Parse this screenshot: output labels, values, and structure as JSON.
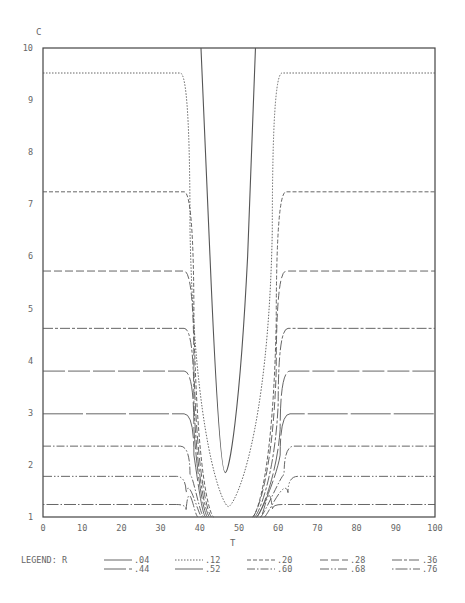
{
  "chart_data": {
    "type": "line",
    "title": "",
    "xlabel": "T",
    "ylabel": "C",
    "xlim": [
      0,
      100
    ],
    "ylim": [
      1,
      10
    ],
    "x_ticks": [
      0,
      10,
      20,
      30,
      40,
      50,
      60,
      70,
      80,
      90,
      100
    ],
    "y_ticks": [
      1,
      2,
      3,
      4,
      5,
      6,
      7,
      8,
      9,
      10
    ],
    "grid": false,
    "legend_title": "LEGEND: R",
    "legend_position": "bottom",
    "series": [
      {
        "name": ".04",
        "dash": "solid",
        "plateau": 10.0,
        "min": 1.85,
        "left_knee": 40.3,
        "right_knee": 54.2,
        "min_t": 46.5,
        "dip_bottom_width": 6
      },
      {
        "name": ".12",
        "dash": "dotted",
        "plateau": 9.52,
        "min": 1.2,
        "left_knee": 35,
        "right_knee": 61,
        "min_t": 47.3,
        "dip_bottom_width": 6
      },
      {
        "name": ".20",
        "dash": "dashed",
        "plateau": 7.24,
        "min": 1.0,
        "left_knee": 36,
        "right_knee": 62,
        "min_t": 47.5,
        "dip_bottom_width": 8
      },
      {
        "name": ".28",
        "dash": "longdash",
        "plateau": 5.72,
        "min": 1.0,
        "left_knee": 36,
        "right_knee": 62,
        "min_t": 47.5,
        "dip_bottom_width": 9
      },
      {
        "name": ".36",
        "dash": "longshort",
        "plateau": 4.62,
        "min": 1.0,
        "left_knee": 36,
        "right_knee": 62.5,
        "min_t": 47.5,
        "dip_bottom_width": 10
      },
      {
        "name": ".44",
        "dash": "solid-gap",
        "plateau": 3.8,
        "min": 1.0,
        "left_knee": 36,
        "right_knee": 63,
        "min_t": 47.5,
        "dip_bottom_width": 11
      },
      {
        "name": ".52",
        "dash": "solid-long",
        "plateau": 2.98,
        "min": 1.0,
        "left_knee": 36,
        "right_knee": 63,
        "min_t": 47.5,
        "dip_bottom_width": 12
      },
      {
        "name": ".60",
        "dash": "dashdot",
        "plateau": 2.36,
        "min": 1.0,
        "left_knee": 35,
        "right_knee": 64,
        "min_t": 47.5,
        "dip_bottom_width": 13
      },
      {
        "name": ".68",
        "dash": "dashdotdot",
        "plateau": 1.78,
        "min": 1.0,
        "left_knee": 34,
        "right_knee": 65,
        "min_t": 47.5,
        "dip_bottom_width": 14
      },
      {
        "name": ".76",
        "dash": "dotdash",
        "plateau": 1.24,
        "min": 1.0,
        "left_knee": 34,
        "right_knee": 61,
        "min_t": 47.5,
        "dip_bottom_width": 16
      }
    ]
  }
}
